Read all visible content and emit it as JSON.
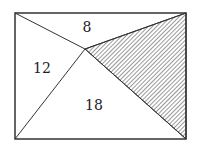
{
  "figure": {
    "type": "geometry-diagram",
    "rectangle": {
      "x1": 15,
      "y1": 13,
      "x2": 186,
      "y2": 139
    },
    "interior_point": {
      "x": 85,
      "y": 49
    },
    "regions": [
      {
        "name": "top",
        "label": "8",
        "label_pos": {
          "x": 87,
          "y": 31
        }
      },
      {
        "name": "left",
        "label": "12",
        "label_pos": {
          "x": 42,
          "y": 72
        }
      },
      {
        "name": "bottom",
        "label": "18",
        "label_pos": {
          "x": 94,
          "y": 109
        }
      },
      {
        "name": "right",
        "label": "",
        "shaded": true
      }
    ],
    "colors": {
      "stroke": "#333333",
      "hatch": "#444444",
      "background": "#ffffff"
    }
  }
}
